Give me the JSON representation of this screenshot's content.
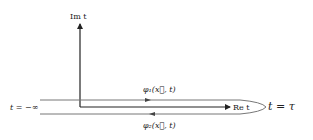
{
  "diagram": {
    "axes": {
      "imaginary_label": "Im t",
      "real_label": "Re t"
    },
    "contour": {
      "start_label": "t = −∞",
      "end_label": "t = τ",
      "upper_branch_label": "φ₁(x⃗, t)",
      "lower_branch_label": "φ₂(x⃗, t)",
      "upper_direction": "right",
      "lower_direction": "left"
    },
    "colors": {
      "axis": "#222222",
      "contour": "#777777",
      "text": "#222222"
    }
  }
}
